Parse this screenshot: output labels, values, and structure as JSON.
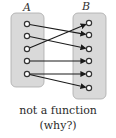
{
  "diagram": {
    "set_a": {
      "label": "A",
      "box": {
        "x": 11,
        "y": 13,
        "w": 33,
        "h": 74
      },
      "label_pos": {
        "x": 27,
        "y": 11
      },
      "dots": [
        {
          "x": 27,
          "y": 24
        },
        {
          "x": 27,
          "y": 36
        },
        {
          "x": 27,
          "y": 49
        },
        {
          "x": 27,
          "y": 61
        },
        {
          "x": 27,
          "y": 74
        }
      ]
    },
    "set_b": {
      "label": "B",
      "box": {
        "x": 73,
        "y": 13,
        "w": 33,
        "h": 86
      },
      "label_pos": {
        "x": 86,
        "y": 10
      },
      "dots": [
        {
          "x": 89,
          "y": 23
        },
        {
          "x": 89,
          "y": 35
        },
        {
          "x": 89,
          "y": 49
        },
        {
          "x": 89,
          "y": 61
        },
        {
          "x": 89,
          "y": 74
        },
        {
          "x": 89,
          "y": 88
        }
      ]
    },
    "mappings": [
      {
        "from": 0,
        "to": 1
      },
      {
        "from": 1,
        "to": 2
      },
      {
        "from": 2,
        "to": 0
      },
      {
        "from": 3,
        "to": 3
      },
      {
        "from": 4,
        "to": 4
      },
      {
        "from": 4,
        "to": 5
      }
    ],
    "colors": {
      "box_fill": "#d9d9d9",
      "box_stroke": "#aaaaaa",
      "line": "#1a1a1a",
      "dot_fill": "#ffffff",
      "dot_stroke": "#333333"
    }
  },
  "caption": {
    "line1": "not a function",
    "line2": "(why?)"
  }
}
